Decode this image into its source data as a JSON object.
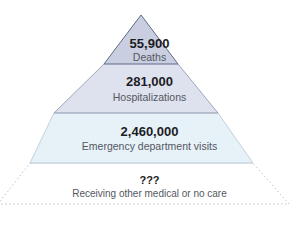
{
  "diagram": {
    "type": "pyramid",
    "tiers": [
      {
        "value": "55,900",
        "label": "Deaths",
        "fill": "#c9cfe0"
      },
      {
        "value": "281,000",
        "label": "Hospitalizations",
        "fill": "#dde2ee"
      },
      {
        "value": "2,460,000",
        "label": "Emergency department visits",
        "fill": "#e6f1f8"
      },
      {
        "value": "???",
        "label": "Receiving other medical or no care",
        "fill": "#ffffff",
        "border": "dotted"
      }
    ]
  }
}
